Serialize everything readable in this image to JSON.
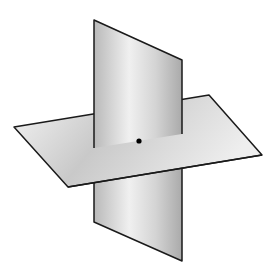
{
  "diagram": {
    "colors": {
      "background": "#ffffff",
      "edge": "#1a1a1a",
      "plane_light": "#f2f2f2",
      "plane_mid": "#c8c8c8",
      "plane_dark": "#a9a9a9",
      "point": "#000000"
    },
    "vertical_plane": {
      "vertices": [
        [
          94,
          20
        ],
        [
          182,
          60
        ],
        [
          182,
          261
        ],
        [
          94,
          222
        ]
      ]
    },
    "horizontal_plane": {
      "vertices": [
        [
          14,
          127
        ],
        [
          209,
          95
        ],
        [
          262,
          155
        ],
        [
          68,
          187
        ]
      ]
    },
    "point": {
      "x": 139,
      "y": 141,
      "r": 2.6
    }
  }
}
